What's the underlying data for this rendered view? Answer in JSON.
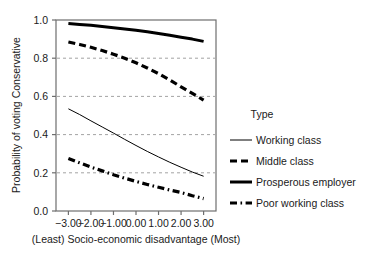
{
  "chart_data": {
    "type": "line",
    "title": "",
    "xlabel": "(Least) Socio-economic disadvantage (Most)",
    "ylabel": "Probability of voting Conservative",
    "xlim": [
      -3.55,
      3.55
    ],
    "ylim": [
      0.0,
      1.0
    ],
    "xticks": [
      -3,
      -2,
      -1,
      0,
      1,
      2,
      3
    ],
    "xticklabels": [
      "-3.00",
      "-2.00",
      "-1.00",
      "0.00",
      "1.00",
      "2.00",
      "3.00"
    ],
    "yticks": [
      0.0,
      0.2,
      0.4,
      0.6,
      0.8,
      1.0
    ],
    "yticklabels": [
      "0.0",
      "0.2",
      "0.4",
      "0.6",
      "0.8",
      "1.0"
    ],
    "grid": "horizontal-dashed-at-0.2-0.4-0.6-0.8",
    "legend_position": "right",
    "legend_title": "Type",
    "x": [
      -3,
      -2.5,
      -2,
      -1.5,
      -1,
      -0.5,
      0,
      0.5,
      1,
      1.5,
      2,
      2.5,
      3
    ],
    "series": [
      {
        "name": "Working class",
        "style": "solid-thin",
        "color": "#000000",
        "values": [
          0.535,
          0.505,
          0.472,
          0.44,
          0.408,
          0.375,
          0.343,
          0.312,
          0.283,
          0.255,
          0.229,
          0.204,
          0.182
        ]
      },
      {
        "name": "Middle class",
        "style": "dashed",
        "color": "#000000",
        "values": [
          0.885,
          0.872,
          0.857,
          0.84,
          0.821,
          0.8,
          0.776,
          0.749,
          0.719,
          0.686,
          0.65,
          0.616,
          0.58
        ]
      },
      {
        "name": "Prosperous employer",
        "style": "solid-thick",
        "color": "#000000",
        "values": [
          0.982,
          0.977,
          0.972,
          0.966,
          0.96,
          0.953,
          0.946,
          0.938,
          0.929,
          0.92,
          0.91,
          0.9,
          0.888
        ]
      },
      {
        "name": "Poor working class",
        "style": "dash-dot",
        "color": "#000000",
        "values": [
          0.275,
          0.252,
          0.23,
          0.21,
          0.19,
          0.172,
          0.155,
          0.139,
          0.124,
          0.11,
          0.097,
          0.08,
          0.065
        ]
      }
    ]
  },
  "legend": {
    "title": "Type",
    "entries": [
      {
        "label": "Working class",
        "style": "solid-thin"
      },
      {
        "label": "Middle class",
        "style": "dashed"
      },
      {
        "label": "Prosperous employer",
        "style": "solid-thick"
      },
      {
        "label": "Poor working class",
        "style": "dash-dot"
      }
    ]
  },
  "axes": {
    "y_title": "Probability of voting Conservative",
    "x_title": "(Least) Socio-economic disadvantage (Most)",
    "y_ticks": [
      "1.0",
      "0.8",
      "0.6",
      "0.4",
      "0.2",
      "0.0"
    ],
    "x_ticks": [
      "-3.00",
      "-2.00",
      "-1.00",
      "0.00",
      "1.00",
      "2.00",
      "3.00"
    ]
  },
  "colors": {
    "line": "#000000",
    "frame": "#6e6e6e",
    "grid": "#8c8c8c",
    "background": "#ffffff"
  }
}
